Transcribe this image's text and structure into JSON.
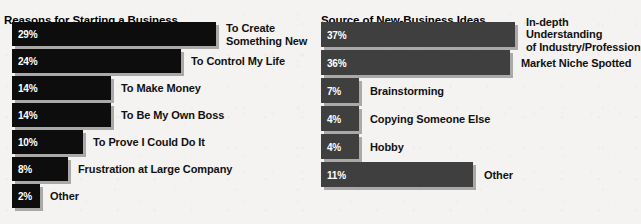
{
  "background_color": "#f4f3f1",
  "charts": [
    {
      "id": "reasons-for-starting-a-business",
      "title": "Reasons for Starting a Business",
      "bar_color": "#0d0d0d",
      "value_text_color": "#ffffff",
      "label_text_color": "#111111",
      "rows": [
        {
          "value_label": "29%",
          "label": "To Create\nSomething New"
        },
        {
          "value_label": "24%",
          "label": "To Control My Life"
        },
        {
          "value_label": "14%",
          "label": "To Make Money"
        },
        {
          "value_label": "14%",
          "label": "To Be My Own Boss"
        },
        {
          "value_label": "10%",
          "label": "To Prove I Could Do It"
        },
        {
          "value_label": "8%",
          "label": "Frustration at Large Company"
        },
        {
          "value_label": "2%",
          "label": "Other"
        }
      ]
    },
    {
      "id": "source-of-new-business-ideas",
      "title": "Source of New-Business Ideas",
      "bar_color": "#3f3f3f",
      "value_text_color": "#ffffff",
      "label_text_color": "#111111",
      "rows": [
        {
          "value_label": "37%",
          "label": "In-depth Understanding\nof Industry/Profession"
        },
        {
          "value_label": "36%",
          "label": "Market Niche Spotted"
        },
        {
          "value_label": "7%",
          "label": "Brainstorming"
        },
        {
          "value_label": "4%",
          "label": "Copying Someone Else"
        },
        {
          "value_label": "4%",
          "label": "Hobby"
        },
        {
          "value_label": "11%",
          "label": "Other"
        }
      ]
    }
  ],
  "chart_data": [
    {
      "type": "bar",
      "orientation": "horizontal",
      "title": "Reasons for Starting a Business",
      "xlabel": "",
      "ylabel": "",
      "grid": false,
      "legend": "none",
      "value_suffix": "%",
      "xlim": [
        0,
        29
      ],
      "categories": [
        "To Create Something New",
        "To Control My Life",
        "To Make Money",
        "To Be My Own Boss",
        "To Prove I Could Do It",
        "Frustration at Large Company",
        "Other"
      ],
      "values": [
        29,
        24,
        14,
        14,
        10,
        8,
        2
      ]
    },
    {
      "type": "bar",
      "orientation": "horizontal",
      "title": "Source of New-Business Ideas",
      "xlabel": "",
      "ylabel": "",
      "grid": false,
      "legend": "none",
      "value_suffix": "%",
      "xlim": [
        0,
        37
      ],
      "categories": [
        "In-depth Understanding of Industry/Profession",
        "Market Niche Spotted",
        "Brainstorming",
        "Copying Someone Else",
        "Hobby",
        "Other"
      ],
      "values": [
        37,
        36,
        7,
        4,
        4,
        11
      ]
    }
  ],
  "layout": {
    "left": {
      "bar_x": 12,
      "first_row_top": 22,
      "row_pitch": 27,
      "bar_height": 24,
      "px_per_unit": 7.05,
      "min_bar_px": 28,
      "label_gap": 10
    },
    "right": {
      "bar_x": 1,
      "first_row_top": 22,
      "row_pitch": 28,
      "bar_height": 25,
      "px_per_unit": 5.25,
      "min_bar_px": 38,
      "label_gap": 11,
      "bar_px_overrides": {
        "5": 152
      }
    }
  }
}
